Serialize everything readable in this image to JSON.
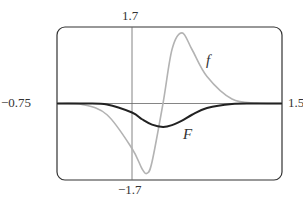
{
  "chart_data": {
    "type": "line",
    "title": "",
    "xlabel": "",
    "ylabel": "",
    "xlim": [
      -0.75,
      1.5
    ],
    "ylim": [
      -1.7,
      1.7
    ],
    "tick_labels": {
      "ymax": "1.7",
      "ymin": "−1.7",
      "xmin": "−0.75",
      "xmax": "1.5"
    },
    "grid": false,
    "legend": "inline labels",
    "series": [
      {
        "name": "f",
        "color": "#b3b3b3",
        "description": "derivative: trough ~(0.15,-1.55), zero at ~0.31, peak ~(0.5,1.57)",
        "x": [
          -0.75,
          -0.5,
          -0.25,
          0,
          0.1,
          0.15,
          0.2,
          0.31,
          0.4,
          0.5,
          0.6,
          0.75,
          1.0,
          1.25,
          1.5
        ],
        "y": [
          0,
          -0.02,
          -0.25,
          -1.0,
          -1.45,
          -1.55,
          -1.3,
          0,
          1.2,
          1.57,
          1.2,
          0.6,
          0.1,
          0.01,
          0
        ]
      },
      {
        "name": "F",
        "color": "#222222",
        "description": "antiderivative: minimum ~(0.31,-0.52)",
        "x": [
          -0.75,
          -0.5,
          -0.25,
          0,
          0.1,
          0.2,
          0.31,
          0.4,
          0.5,
          0.6,
          0.75,
          1.0,
          1.25,
          1.5
        ],
        "y": [
          0,
          0,
          -0.02,
          -0.2,
          -0.35,
          -0.47,
          -0.52,
          -0.48,
          -0.38,
          -0.25,
          -0.1,
          -0.01,
          0,
          0
        ]
      }
    ]
  }
}
